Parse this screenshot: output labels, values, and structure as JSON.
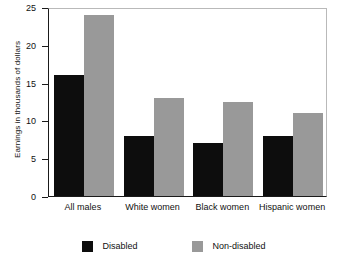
{
  "chart_data": {
    "type": "bar",
    "title": "",
    "xlabel": "",
    "ylabel": "Earnings in thousands of dollars",
    "ylim": [
      0,
      25
    ],
    "yticks": [
      0,
      5,
      10,
      15,
      20,
      25
    ],
    "ytick_labels": [
      "0",
      "5",
      "10",
      "15",
      "20",
      "25"
    ],
    "grid": false,
    "legend_position": "bottom-center",
    "categories": [
      "All males",
      "White women",
      "Black women",
      "Hispanic women"
    ],
    "series": [
      {
        "name": "Disabled",
        "color": "#0d0d0d",
        "values": [
          16,
          8,
          7,
          8
        ]
      },
      {
        "name": "Non-disabled",
        "color": "#999999",
        "values": [
          24,
          13,
          12.5,
          11
        ]
      }
    ]
  },
  "legend": {
    "items": [
      {
        "label": "Disabled",
        "color": "#0d0d0d"
      },
      {
        "label": "Non-disabled",
        "color": "#999999"
      }
    ]
  },
  "colors": {
    "disabled": "#0d0d0d",
    "non_disabled": "#999999",
    "axis": "#1a1a1a",
    "frame": "#b9b9b9",
    "background": "#ffffff"
  }
}
